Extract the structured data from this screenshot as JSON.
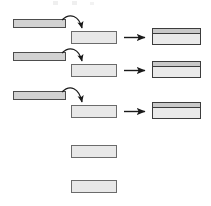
{
  "figure": {
    "title": "",
    "background_color": "#ffffff",
    "width": 211,
    "height": 206
  },
  "palette": {
    "source_bar_fill": "#d2d2d2",
    "source_bar_stroke": "#4d4d4d",
    "middle_box_fill": "#e8e8e8",
    "middle_box_stroke": "#6b6b6b",
    "result_box_top_fill": "#c9c9c9",
    "result_box_bottom_fill": "#eaeaea",
    "result_box_stroke": "#3c3c3c",
    "arrow_color": "#1a1a1a",
    "curved_arrow_color": "#1a1a1a"
  },
  "chart_data": {
    "type": "diagram",
    "title": "",
    "columns": [
      {
        "name": "source",
        "label": "",
        "x": 13,
        "width": 52
      },
      {
        "name": "middle",
        "label": "",
        "x": 71,
        "width": 45
      },
      {
        "name": "result",
        "label": "",
        "x": 152,
        "width": 48
      }
    ],
    "rows": [
      {
        "index": 1,
        "source_bar": {
          "x": 13,
          "y": 19,
          "width": 52,
          "height": 8,
          "fill": "#d2d2d2"
        },
        "curved_arrow": {
          "from_x": 62,
          "from_y": 20,
          "to_x": 82,
          "to_y": 30,
          "peak_y": 12
        },
        "middle_box": {
          "x": 71,
          "y": 31,
          "width": 45,
          "height": 12,
          "fill": "#e8e8e8"
        },
        "straight_arrow": {
          "from_x": 124,
          "from_y": 37,
          "to_x": 147,
          "to_y": 37
        },
        "result_box": {
          "x": 152,
          "y": 28,
          "width": 48,
          "height": 16,
          "top_band_height": 5
        }
      },
      {
        "index": 2,
        "source_bar": {
          "x": 13,
          "y": 52,
          "width": 52,
          "height": 8,
          "fill": "#d2d2d2"
        },
        "curved_arrow": {
          "from_x": 62,
          "from_y": 53,
          "to_x": 82,
          "to_y": 63,
          "peak_y": 45
        },
        "middle_box": {
          "x": 71,
          "y": 64,
          "width": 45,
          "height": 12,
          "fill": "#e8e8e8"
        },
        "straight_arrow": {
          "from_x": 124,
          "from_y": 70,
          "to_x": 147,
          "to_y": 70
        },
        "result_box": {
          "x": 152,
          "y": 61,
          "width": 48,
          "height": 16,
          "top_band_height": 5
        }
      },
      {
        "index": 3,
        "source_bar": {
          "x": 13,
          "y": 91,
          "width": 52,
          "height": 8,
          "fill": "#d2d2d2"
        },
        "curved_arrow": {
          "from_x": 62,
          "from_y": 92,
          "to_x": 82,
          "to_y": 104,
          "peak_y": 84
        },
        "middle_box": {
          "x": 71,
          "y": 105,
          "width": 45,
          "height": 12,
          "fill": "#e8e8e8"
        },
        "straight_arrow": {
          "from_x": 124,
          "from_y": 111,
          "to_x": 147,
          "to_y": 111
        },
        "result_box": {
          "x": 152,
          "y": 102,
          "width": 48,
          "height": 16,
          "top_band_height": 5
        }
      }
    ],
    "extra_middle_boxes": [
      {
        "index": 4,
        "x": 71,
        "y": 145,
        "width": 45,
        "height": 12,
        "fill": "#e8e8e8"
      },
      {
        "index": 5,
        "x": 71,
        "y": 180,
        "width": 45,
        "height": 12,
        "fill": "#e8e8e8"
      }
    ],
    "counts": {
      "source_bars": 3,
      "curved_arrows": 3,
      "middle_boxes": 5,
      "straight_arrows": 3,
      "result_boxes": 3
    }
  }
}
